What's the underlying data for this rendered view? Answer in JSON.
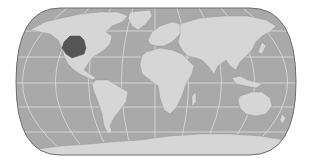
{
  "map": {
    "title": "World map with highlighted region",
    "projection": "pseudo-cylindrical (Robinson-like)",
    "style": "grayscale",
    "colors": {
      "background": "#ffffff",
      "ocean": "#a9a9a9",
      "land": "#d6d6d6",
      "highlight": "#555555",
      "graticule": "#e4e4e4",
      "outline": "#6e6e6e"
    },
    "graticule": {
      "parallels_deg": [
        60,
        30,
        0,
        -30,
        -60
      ],
      "meridians_step_deg": 30
    },
    "highlighted_region": {
      "label": "Central United States (Great Plains)",
      "color": "#555555"
    }
  }
}
